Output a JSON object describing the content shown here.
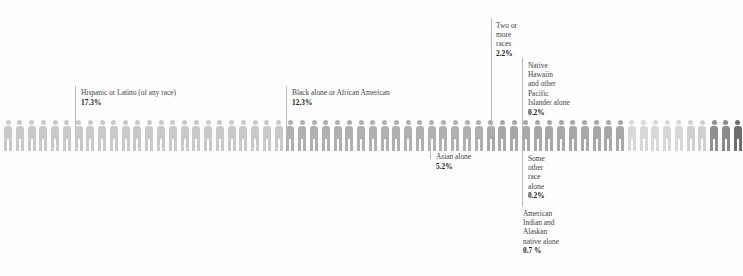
{
  "chart_data": {
    "type": "pictogram",
    "title": "",
    "unit_label": "1 figure = 1 percent of population",
    "total_units": 100,
    "figure_icon": "person-icon",
    "categories": [
      "White alone",
      "Hispanic or Latino (of any race)",
      "Black alone or African American",
      "Asian alone",
      "Two or more races",
      "American Indian and Alaskan native alone",
      "Native Hawaiin and other Pacific Islander alone",
      "Some other race alone"
    ],
    "values": [
      61.6,
      17.3,
      12.3,
      5.2,
      2.2,
      0.7,
      0.2,
      0.2
    ],
    "xlabel": "",
    "ylabel": "",
    "grid": false,
    "legend_position": "none"
  },
  "segments": [
    {
      "id": "white",
      "label": "",
      "pct": "",
      "count": 24,
      "color": "#c9c9c9"
    },
    {
      "id": "hispanic",
      "label": "Hispanic or Latino (of any race)",
      "pct": "17.3%",
      "count": 17,
      "color": "#b0b0b0"
    },
    {
      "id": "black",
      "label": "Black alone or African American",
      "pct": "12.3%",
      "count": 12,
      "color": "#a8a8a8"
    },
    {
      "id": "asian",
      "label": "Asian alone",
      "pct": "5.2%",
      "count": 5,
      "color": "#d8d8d8"
    },
    {
      "id": "twomore",
      "label": "Two or\nmore\nraces",
      "pct": "2.2%",
      "count": 2,
      "color": "#cfcfcf"
    },
    {
      "id": "aian",
      "label": "American\nIndian and\nAlaskan\nnative alone",
      "pct": "0.7 %",
      "count": 1,
      "color": "#909090"
    },
    {
      "id": "nhpi",
      "label": "Native\nHawaiin\nand other\nPacific\nIslander alone",
      "pct": "0.2%",
      "count": 1,
      "color": "#8a8a8a"
    },
    {
      "id": "other",
      "label": "Some\nother\nrace\nalone",
      "pct": "0.2%",
      "count": 1,
      "color": "#6e6e6e"
    }
  ],
  "callouts": {
    "hispanic": {
      "name": "Hispanic or Latino (of any race)",
      "pct": "17.3%"
    },
    "black": {
      "name": "Black alone or African American",
      "pct": "12.3%"
    },
    "asian": {
      "name": "Asian alone",
      "pct": "5.2%"
    },
    "twomore": {
      "name": "Two or\nmore\nraces",
      "pct": "2.2%"
    },
    "nhpi": {
      "name": "Native\nHawaiin\nand other\nPacific\nIslander alone",
      "pct": "0.2%"
    },
    "other": {
      "name": "Some\nother\nrace\nalone",
      "pct": "0.2%"
    },
    "aian": {
      "name": "American\nIndian and\nAlaskan\nnative alone",
      "pct": "0.7 %"
    }
  },
  "colors": {
    "background": "#fdfdfd",
    "leader_line": "#b9b9b9",
    "text": "#444444",
    "text_bold": "#222222"
  }
}
